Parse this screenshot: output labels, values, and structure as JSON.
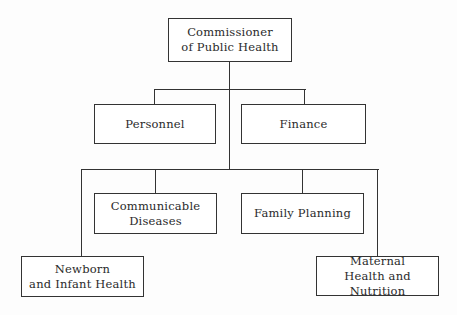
{
  "diagram": {
    "type": "organizational-chart",
    "root": {
      "id": "commissioner",
      "lines": [
        "Commissioner",
        "of Public Health"
      ]
    },
    "level1": [
      {
        "id": "personnel",
        "lines": [
          "Personnel"
        ]
      },
      {
        "id": "finance",
        "lines": [
          "Finance"
        ]
      }
    ],
    "level2": [
      {
        "id": "communicable-diseases",
        "lines": [
          "Communicable",
          "Diseases"
        ]
      },
      {
        "id": "family-planning",
        "lines": [
          "Family Planning"
        ]
      }
    ],
    "level3": [
      {
        "id": "newborn-infant-health",
        "lines": [
          "Newborn",
          "and Infant Health"
        ]
      },
      {
        "id": "maternal-health-nutrition",
        "lines": [
          "Maternal",
          "Health and Nutrition"
        ]
      }
    ],
    "edges": [
      [
        "commissioner",
        "personnel"
      ],
      [
        "commissioner",
        "finance"
      ],
      [
        "commissioner",
        "communicable-diseases"
      ],
      [
        "commissioner",
        "family-planning"
      ],
      [
        "commissioner",
        "newborn-infant-health"
      ],
      [
        "commissioner",
        "maternal-health-nutrition"
      ]
    ],
    "colors": {
      "line": "#333333",
      "text": "#2a2a2a",
      "background": "#fdfdfd"
    }
  }
}
